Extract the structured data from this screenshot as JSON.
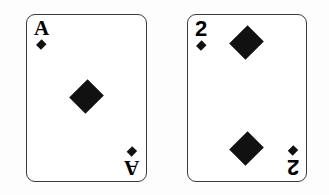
{
  "scene": {
    "background_color": "#fdfdfd",
    "description": "Two playing cards of the diamond suit shown side by side on a plain white background",
    "card_count": 2
  },
  "style": {
    "card_face_color": "#ffffff",
    "card_border_color": "#3a3a3a",
    "pip_color": "#111111",
    "rank_color": "#000000"
  },
  "cards": [
    {
      "name": "ace-of-diamonds",
      "rank": "A",
      "rank_spoken": "Ace",
      "suit": "diamonds",
      "suit_symbol": "♦",
      "pip_count": 1,
      "corner_top_left": {
        "rank": "A",
        "suit_symbol": "♦"
      },
      "corner_bottom_right": {
        "rank": "A",
        "suit_symbol": "♦",
        "rotated": "180"
      }
    },
    {
      "name": "two-of-diamonds",
      "rank": "2",
      "rank_spoken": "Two",
      "suit": "diamonds",
      "suit_symbol": "♦",
      "pip_count": 2,
      "corner_top_left": {
        "rank": "2",
        "suit_symbol": "♦"
      },
      "corner_bottom_right": {
        "rank": "2",
        "suit_symbol": "♦",
        "rotated": "180"
      }
    }
  ]
}
